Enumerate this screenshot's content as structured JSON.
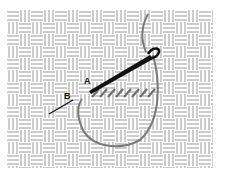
{
  "diagram": {
    "kind": "basketweave canvas with needle and thread",
    "labels": {
      "a": "A",
      "b": "B"
    },
    "colors": {
      "background": "#ffffff",
      "canvas_lines": "#9a9a9a",
      "needle": "#111111",
      "thread": "#7a7a7a",
      "stitches": "#6e6e6e"
    },
    "canvas": {
      "left": 7,
      "top": 10,
      "right": 213,
      "bottom": 168,
      "cell": 12
    },
    "stitch_count": 8
  }
}
